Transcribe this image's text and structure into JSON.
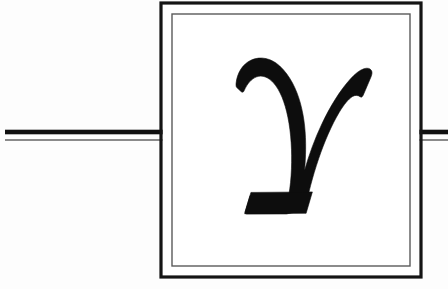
{
  "diagram": {
    "background_color": "#fdfdfd",
    "ink_color": "#111111",
    "secondary_ink_color": "#555555",
    "canvas": {
      "width": 448,
      "height": 289
    }
  },
  "symbol": {
    "name": "greek-small-letter-gamma",
    "character": "γ",
    "label": "gamma",
    "color": "#0d0d0d",
    "bbox": {
      "x": 236,
      "y": 58,
      "width": 136,
      "height": 156
    }
  },
  "box": {
    "name": "double-bordered-box",
    "outer": {
      "x": 161,
      "y": 3,
      "width": 260,
      "height": 274,
      "stroke_width": 3.2,
      "color": "#141414"
    },
    "inner": {
      "x": 172,
      "y": 14,
      "width": 238,
      "height": 252,
      "stroke_width": 1.4,
      "color": "#5a5a5a"
    },
    "fill": "#ffffff"
  },
  "lines": {
    "left": {
      "name": "left-lead-line",
      "x_start": 5,
      "x_end": 164,
      "thick_y": 132,
      "thick_width": 4.6,
      "thin_y": 140,
      "thin_width": 1.3,
      "thick_color": "#101010",
      "thin_color": "#4e4e4e"
    },
    "right": {
      "name": "right-lead-line",
      "x_start": 418,
      "x_end": 448,
      "thick_y": 132,
      "thick_width": 4.6,
      "thin_y": 140,
      "thin_width": 1.3,
      "thick_color": "#101010",
      "thin_color": "#4e4e4e"
    }
  }
}
